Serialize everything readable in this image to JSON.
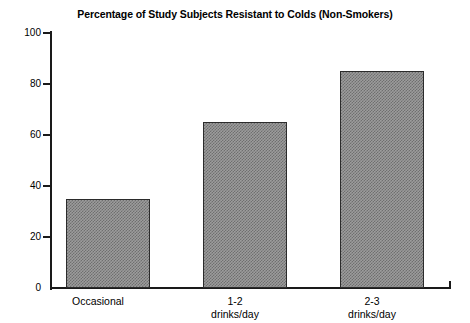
{
  "chart_data": {
    "type": "bar",
    "title": "Percentage of Study Subjects Resistant to Colds (Non-Smokers)",
    "xlabel": "",
    "ylabel": "",
    "categories": [
      "Occasional",
      "1-2 drinks/day",
      "2-3 drinks/day"
    ],
    "category_lines": [
      {
        "line1": "Occasional",
        "line2": ""
      },
      {
        "line1": "1-2",
        "line2": "drinks/day"
      },
      {
        "line1": "2-3",
        "line2": "drinks/day"
      }
    ],
    "values": [
      35,
      65,
      85
    ],
    "ylim": [
      0,
      100
    ],
    "yticks": [
      0,
      20,
      40,
      60,
      80,
      100
    ],
    "ytick_labels": [
      "0",
      "20",
      "40",
      "60",
      "80",
      "100"
    ],
    "grid": false,
    "legend": false,
    "legend_position": "none",
    "bar_fill_color": "#9c9c9c",
    "bar_edge_color": "#2b2b2b",
    "axis_color": "#1a1a1a",
    "background_color": "#ffffff"
  }
}
